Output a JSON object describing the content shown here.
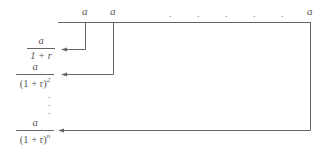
{
  "diagram": {
    "timeline": {
      "payment_labels": [
        "a",
        "a",
        "a"
      ],
      "ellipsis_dots": [
        ".",
        ".",
        ".",
        ".",
        "."
      ]
    },
    "present_values": [
      {
        "numerator": "a",
        "denominator": "1 + r",
        "exponent": ""
      },
      {
        "numerator": "a",
        "denominator": "(1 + r)",
        "exponent": "2"
      },
      {
        "numerator": "a",
        "denominator": "(1 + r)",
        "exponent": "n"
      }
    ],
    "vertical_ellipsis": [
      ".",
      ".",
      "."
    ],
    "colors": {
      "line": "#666666",
      "text": "#555555",
      "background": "#ffffff"
    }
  }
}
